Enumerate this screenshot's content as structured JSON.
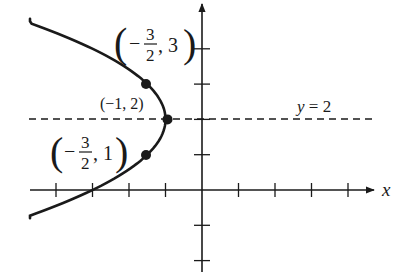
{
  "figure": {
    "equation": "x = -(y - 2)^2 / 2 - 1",
    "colors": {
      "ink": "#1a1a1a",
      "background": "#ffffff"
    },
    "axes": {
      "x_label": "x",
      "origin_px": [
        202,
        190
      ],
      "unit_px": [
        36.5,
        35.3
      ],
      "x_ticks": [
        -4,
        -3,
        -2,
        -1,
        1,
        2,
        3,
        4
      ],
      "y_ticks": [
        -2,
        -1,
        1,
        2,
        3,
        4
      ],
      "x_range": [
        -4.8,
        4.8
      ],
      "y_range": [
        -2.3,
        5.3
      ]
    },
    "axis_of_symmetry": {
      "label_lhs": "y",
      "label_rhs": " = 2",
      "y": 2
    },
    "points": [
      {
        "name": "point-top",
        "x": -1.5,
        "y": 3,
        "label": {
          "open": "(",
          "minus": "−",
          "num": "3",
          "den": "2",
          "sep": ", ",
          "val": "3",
          "close": ")"
        }
      },
      {
        "name": "point-vertex",
        "x": -1,
        "y": 2,
        "label_text": "(−1, 2)"
      },
      {
        "name": "point-bottom",
        "x": -1.5,
        "y": 1,
        "label": {
          "open": "(",
          "minus": "−",
          "num": "3",
          "den": "2",
          "sep": ", ",
          "val": "1",
          "close": ")"
        }
      }
    ]
  }
}
